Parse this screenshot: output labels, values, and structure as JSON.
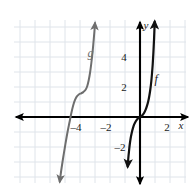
{
  "figure": {
    "width": 196,
    "height": 195,
    "background_color": "#ffffff"
  },
  "grid": {
    "color": "#dfe4ea",
    "cell_px": 15,
    "left_px": 14,
    "top_px": 20,
    "right_px": 186,
    "bottom_px": 183,
    "visible": true
  },
  "axes": {
    "color": "#000000",
    "origin_px": {
      "x": 140,
      "y": 117
    },
    "unit_px": 15,
    "x_axis": {
      "name": "x",
      "name_pos": {
        "x": 181,
        "y": 129
      },
      "arrows": "both",
      "from_px": {
        "x": 16,
        "y": 117
      },
      "to_px": {
        "x": 188,
        "y": 117
      }
    },
    "y_axis": {
      "name": "y",
      "name_pos": {
        "x": 146,
        "y": 29
      },
      "arrows": "both",
      "from_px": {
        "x": 140,
        "y": 22
      },
      "to_px": {
        "x": 140,
        "y": 184
      }
    },
    "x_ticks": [
      {
        "label": "–4",
        "value": -4,
        "x_px": 76,
        "y_px": 131
      },
      {
        "label": "–2",
        "value": -2,
        "x_px": 106,
        "y_px": 131
      },
      {
        "label": "2",
        "value": 2,
        "x_px": 167,
        "y_px": 131
      }
    ],
    "y_ticks": [
      {
        "label": "4",
        "value": 4,
        "x_px": 124,
        "y_px": 61
      },
      {
        "label": "2",
        "value": 2,
        "x_px": 124,
        "y_px": 91
      },
      {
        "label": "–2",
        "value": -2,
        "x_px": 120,
        "y_px": 151
      }
    ]
  },
  "chart_data": {
    "type": "line",
    "title": "",
    "xlabel": "x",
    "ylabel": "y",
    "xlim": [
      -8.4,
      3.2
    ],
    "ylim": [
      -4.4,
      6.5
    ],
    "grid": true,
    "legend": "inline-curve-labels",
    "series": [
      {
        "name": "g",
        "label": "g",
        "color": "#6e6e6e",
        "label_pos": {
          "x": -3.3,
          "y": 4.0
        },
        "description": "cubic S-curve shifted left with flat inflection near (-4.2, 1.5)",
        "arrow_start": true,
        "arrow_end": true,
        "points": [
          [
            -5.35,
            -4.3
          ],
          [
            -5.25,
            -3.55
          ],
          [
            -5.12,
            -2.7
          ],
          [
            -4.98,
            -1.85
          ],
          [
            -4.84,
            -1.05
          ],
          [
            -4.7,
            -0.35
          ],
          [
            -4.58,
            0.25
          ],
          [
            -4.46,
            0.75
          ],
          [
            -4.34,
            1.12
          ],
          [
            -4.22,
            1.36
          ],
          [
            -4.08,
            1.5
          ],
          [
            -3.92,
            1.58
          ],
          [
            -3.78,
            1.66
          ],
          [
            -3.64,
            1.8
          ],
          [
            -3.52,
            2.05
          ],
          [
            -3.42,
            2.45
          ],
          [
            -3.33,
            2.95
          ],
          [
            -3.25,
            3.55
          ],
          [
            -3.17,
            4.25
          ],
          [
            -3.1,
            5.0
          ],
          [
            -3.04,
            5.7
          ],
          [
            -3.0,
            6.25
          ]
        ]
      },
      {
        "name": "f",
        "label": "f",
        "color": "#111111",
        "label_pos": {
          "x": 1.08,
          "y": 2.3
        },
        "description": "steep cubic through the origin",
        "arrow_start": true,
        "arrow_end": true,
        "points": [
          [
            -0.82,
            -3.3
          ],
          [
            -0.78,
            -2.75
          ],
          [
            -0.73,
            -2.25
          ],
          [
            -0.68,
            -1.8
          ],
          [
            -0.62,
            -1.4
          ],
          [
            -0.55,
            -1.05
          ],
          [
            -0.47,
            -0.74
          ],
          [
            -0.38,
            -0.48
          ],
          [
            -0.28,
            -0.28
          ],
          [
            -0.17,
            -0.13
          ],
          [
            -0.06,
            -0.03
          ],
          [
            0.05,
            0.03
          ],
          [
            0.16,
            0.12
          ],
          [
            0.27,
            0.27
          ],
          [
            0.37,
            0.47
          ],
          [
            0.46,
            0.72
          ],
          [
            0.55,
            1.05
          ],
          [
            0.62,
            1.4
          ],
          [
            0.69,
            1.85
          ],
          [
            0.75,
            2.35
          ],
          [
            0.8,
            2.9
          ],
          [
            0.85,
            3.55
          ],
          [
            0.89,
            4.25
          ],
          [
            0.93,
            5.05
          ],
          [
            0.96,
            5.8
          ],
          [
            0.98,
            6.35
          ]
        ]
      }
    ]
  }
}
